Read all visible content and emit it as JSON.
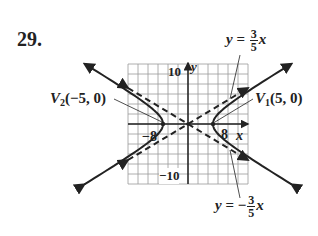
{
  "problem": {
    "number": "29."
  },
  "graph": {
    "x_axis_label": "x",
    "y_axis_label": "y",
    "tick_labels": {
      "y_top": "10",
      "y_bottom": "−10",
      "x_left": "−8",
      "x_right": "8"
    },
    "grid": {
      "min": -12,
      "max": 12,
      "step": 2
    }
  },
  "annotations": {
    "v2": {
      "name": "V",
      "sub": "2",
      "coords": "(−5, 0)"
    },
    "v1": {
      "name": "V",
      "sub": "1",
      "coords": "(5, 0)"
    },
    "asymptote_pos": {
      "lhs": "y",
      "eq": " = ",
      "num": "3",
      "den": "5",
      "var": "x"
    },
    "asymptote_neg": {
      "lhs": "y",
      "eq": " = −",
      "num": "3",
      "den": "5",
      "var": "x"
    }
  },
  "colors": {
    "ink": "#222222",
    "grid": "#9a9a9a",
    "background": "#ffffff"
  }
}
